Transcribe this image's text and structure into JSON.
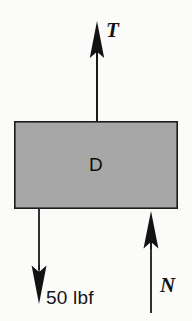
{
  "figure": {
    "type": "free-body-diagram",
    "background_color": "#fbfbfa",
    "body": {
      "label": "D",
      "shape": "rectangle",
      "fill_color": "#a9a9a9",
      "stroke_color": "#1a1a1a",
      "x": 14,
      "y": 121,
      "width": 164,
      "height": 88
    },
    "forces": [
      {
        "name": "tension",
        "label": "T",
        "direction": "up",
        "label_style": "italic-serif",
        "color": "#141414",
        "tail_x": 97,
        "tail_y": 121,
        "tip_x": 97,
        "tip_y": 22
      },
      {
        "name": "weight",
        "label": "50 lbf",
        "direction": "down",
        "label_style": "sans",
        "color": "#141414",
        "tail_x": 39,
        "tail_y": 209,
        "tip_x": 39,
        "tip_y": 303
      },
      {
        "name": "normal",
        "label": "N",
        "direction": "up",
        "label_style": "italic-serif",
        "color": "#141414",
        "tail_x": 151,
        "tail_y": 311,
        "tip_x": 151,
        "tip_y": 211
      }
    ]
  }
}
